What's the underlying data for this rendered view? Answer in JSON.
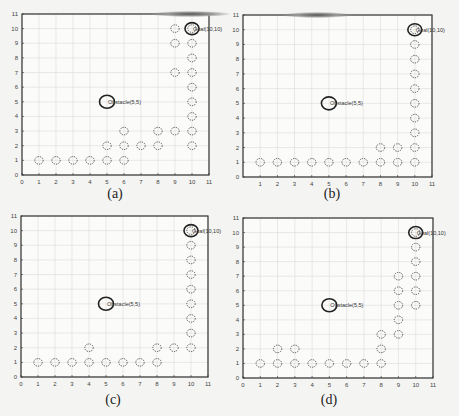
{
  "figure": {
    "captions": [
      "(a)",
      "(b)",
      "(c)",
      "(d)"
    ]
  },
  "chart_data": [
    {
      "type": "scatter",
      "panel": "(a)",
      "xlim": [
        0,
        11
      ],
      "ylim": [
        0,
        11
      ],
      "xticks": [
        0,
        1,
        2,
        3,
        4,
        5,
        6,
        7,
        8,
        9,
        10,
        11
      ],
      "yticks": [
        0,
        1,
        2,
        3,
        4,
        5,
        6,
        7,
        8,
        9,
        10,
        11
      ],
      "grid": true,
      "obstacle": {
        "x": 5,
        "y": 5,
        "label": "Obstacle(5,5)"
      },
      "goal": {
        "x": 10,
        "y": 10,
        "label": "Goal(10,10)"
      },
      "path_points": [
        [
          1,
          1
        ],
        [
          2,
          1
        ],
        [
          3,
          1
        ],
        [
          4,
          1
        ],
        [
          5,
          1
        ],
        [
          6,
          1
        ],
        [
          5,
          2
        ],
        [
          6,
          2
        ],
        [
          7,
          2
        ],
        [
          8,
          2
        ],
        [
          6,
          3
        ],
        [
          8,
          3
        ],
        [
          9,
          3
        ],
        [
          10,
          2
        ],
        [
          10,
          3
        ],
        [
          10,
          4
        ],
        [
          10,
          5
        ],
        [
          10,
          6
        ],
        [
          10,
          7
        ],
        [
          9,
          7
        ],
        [
          10,
          8
        ],
        [
          9,
          9
        ],
        [
          10,
          9
        ],
        [
          9,
          10
        ],
        [
          10,
          10
        ]
      ]
    },
    {
      "type": "scatter",
      "panel": "(b)",
      "xlim": [
        0,
        11
      ],
      "ylim": [
        0,
        11
      ],
      "xticks": [
        1,
        2,
        3,
        4,
        5,
        6,
        7,
        8,
        9,
        10,
        11
      ],
      "yticks": [
        0,
        1,
        2,
        3,
        4,
        5,
        6,
        7,
        8,
        9,
        10,
        11
      ],
      "grid": true,
      "obstacle": {
        "x": 5,
        "y": 5,
        "label": "Obstacle(5,5)"
      },
      "goal": {
        "x": 10,
        "y": 10,
        "label": "Goal(10,10)"
      },
      "path_points": [
        [
          1,
          1
        ],
        [
          2,
          1
        ],
        [
          3,
          1
        ],
        [
          4,
          1
        ],
        [
          5,
          1
        ],
        [
          6,
          1
        ],
        [
          7,
          1
        ],
        [
          8,
          1
        ],
        [
          9,
          1
        ],
        [
          10,
          1
        ],
        [
          8,
          2
        ],
        [
          9,
          2
        ],
        [
          10,
          2
        ],
        [
          10,
          3
        ],
        [
          10,
          4
        ],
        [
          10,
          5
        ],
        [
          10,
          6
        ],
        [
          10,
          7
        ],
        [
          10,
          8
        ],
        [
          10,
          9
        ],
        [
          10,
          10
        ]
      ]
    },
    {
      "type": "scatter",
      "panel": "(c)",
      "xlim": [
        0,
        11
      ],
      "ylim": [
        0,
        11
      ],
      "xticks": [
        0,
        1,
        2,
        3,
        4,
        5,
        6,
        7,
        8,
        9,
        10,
        11
      ],
      "yticks": [
        0,
        1,
        2,
        3,
        4,
        5,
        6,
        7,
        8,
        9,
        10,
        11
      ],
      "grid": true,
      "obstacle": {
        "x": 5,
        "y": 5,
        "label": "Obstacle(5,5)"
      },
      "goal": {
        "x": 10,
        "y": 10,
        "label": "Goal(10,10)"
      },
      "path_points": [
        [
          1,
          1
        ],
        [
          2,
          1
        ],
        [
          3,
          1
        ],
        [
          4,
          1
        ],
        [
          5,
          1
        ],
        [
          6,
          1
        ],
        [
          7,
          1
        ],
        [
          8,
          1
        ],
        [
          4,
          2
        ],
        [
          8,
          2
        ],
        [
          9,
          2
        ],
        [
          10,
          2
        ],
        [
          10,
          3
        ],
        [
          10,
          4
        ],
        [
          10,
          5
        ],
        [
          10,
          6
        ],
        [
          10,
          7
        ],
        [
          10,
          8
        ],
        [
          10,
          9
        ],
        [
          10,
          10
        ]
      ]
    },
    {
      "type": "scatter",
      "panel": "(d)",
      "xlim": [
        0,
        11
      ],
      "ylim": [
        0,
        11
      ],
      "xticks": [
        0,
        1,
        2,
        3,
        4,
        5,
        6,
        7,
        8,
        9,
        10,
        11
      ],
      "yticks": [
        0,
        1,
        2,
        3,
        4,
        5,
        6,
        7,
        8,
        9,
        10,
        11
      ],
      "grid": true,
      "obstacle": {
        "x": 5,
        "y": 5,
        "label": "Obstacle(5,5)"
      },
      "goal": {
        "x": 10,
        "y": 10,
        "label": "Goal(10,10)"
      },
      "path_points": [
        [
          1,
          1
        ],
        [
          2,
          1
        ],
        [
          3,
          1
        ],
        [
          4,
          1
        ],
        [
          5,
          1
        ],
        [
          6,
          1
        ],
        [
          7,
          1
        ],
        [
          8,
          1
        ],
        [
          2,
          2
        ],
        [
          3,
          2
        ],
        [
          8,
          2
        ],
        [
          8,
          3
        ],
        [
          9,
          3
        ],
        [
          9,
          4
        ],
        [
          9,
          5
        ],
        [
          9,
          6
        ],
        [
          9,
          7
        ],
        [
          10,
          5
        ],
        [
          10,
          6
        ],
        [
          10,
          7
        ],
        [
          10,
          8
        ],
        [
          10,
          9
        ],
        [
          10,
          10
        ]
      ]
    }
  ]
}
